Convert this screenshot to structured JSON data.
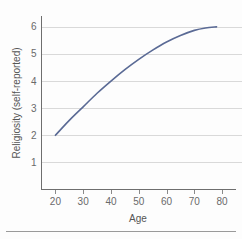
{
  "chart_data": {
    "type": "line",
    "title": "",
    "subtitle": "",
    "xlabel": "Age",
    "ylabel": "Religiosity (self-reported)",
    "xlim": [
      15,
      85
    ],
    "ylim": [
      0,
      6.4
    ],
    "xticks": [
      20,
      30,
      40,
      50,
      60,
      70,
      80
    ],
    "xtick_labels": [
      "20",
      "30",
      "40",
      "50",
      "60",
      "70",
      "80"
    ],
    "yticks": [
      1,
      2,
      3,
      4,
      5,
      6
    ],
    "ytick_labels": [
      "1",
      "2",
      "3",
      "4",
      "5",
      "6"
    ],
    "grid": "horizontal",
    "legend": "none",
    "annotations": [],
    "series": [
      {
        "name": "Religiosity by age",
        "color": "#5a6a95",
        "x": [
          20,
          25,
          30,
          35,
          40,
          45,
          50,
          55,
          60,
          65,
          70,
          74,
          78
        ],
        "y": [
          2.0,
          2.55,
          3.05,
          3.55,
          4.0,
          4.42,
          4.8,
          5.14,
          5.44,
          5.68,
          5.87,
          5.96,
          6.0
        ]
      }
    ]
  },
  "axes": {
    "y_axis_label": "Religiosity (self-reported)",
    "x_axis_label": "Age"
  },
  "colors": {
    "curve": "#5a6a95",
    "gridline": "#d9d9d9",
    "axis": "#6e6e6e",
    "tick_text": "#6a6a6a",
    "background": "#fdfdfd",
    "footer_rule": "#9a9a9a"
  }
}
